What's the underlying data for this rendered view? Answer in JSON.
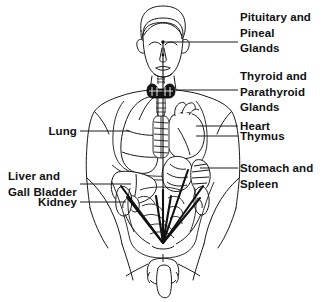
{
  "diagram": {
    "ink_color": "#1a1a1a",
    "fill_color": "#ffffff",
    "gland_color": "#141414",
    "background": "#ffffff"
  },
  "labels": {
    "pituitary_pineal": {
      "id": "pituitary-and-pineal-glands",
      "line1": "Pituitary and",
      "line2": "Pineal",
      "line3": "Glands"
    },
    "thyroid_parathyroid": {
      "id": "thyroid-and-parathyroid-glands",
      "line1": "Thyroid and",
      "line2": "Parathyroid",
      "line3": "Glands"
    },
    "heart": {
      "id": "heart",
      "text": "Heart"
    },
    "thymus": {
      "id": "thymus",
      "text": "Thymus"
    },
    "stomach_spleen": {
      "id": "stomach-and-spleen",
      "line1": "Stomach and",
      "line2": "Spleen"
    },
    "lung": {
      "id": "lung",
      "text": "Lung"
    },
    "liver_gall_bladder": {
      "id": "liver-and-gall-bladder",
      "line1": "Liver and",
      "line2": "Gall Bladder"
    },
    "kidney": {
      "id": "kidney",
      "text": "Kidney"
    }
  },
  "organs": [
    {
      "name": "pineal-gland",
      "side": "center"
    },
    {
      "name": "pituitary-gland",
      "side": "center"
    },
    {
      "name": "thyroid-gland",
      "side": "center"
    },
    {
      "name": "parathyroid-glands",
      "side": "center"
    },
    {
      "name": "thymus",
      "side": "center"
    },
    {
      "name": "heart",
      "side": "right"
    },
    {
      "name": "lung",
      "side": "left"
    },
    {
      "name": "liver",
      "side": "left"
    },
    {
      "name": "gall-bladder",
      "side": "left"
    },
    {
      "name": "stomach",
      "side": "right"
    },
    {
      "name": "spleen",
      "side": "right"
    },
    {
      "name": "kidney",
      "side": "both"
    },
    {
      "name": "intestines",
      "side": "center"
    },
    {
      "name": "gonads",
      "side": "center"
    }
  ]
}
